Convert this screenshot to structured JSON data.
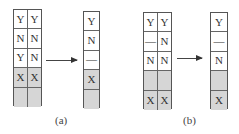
{
  "panels": [
    {
      "label": "(a)",
      "before": {
        "rows": [
          {
            "cells": [
              "Y",
              "Y"
            ],
            "shaded": false
          },
          {
            "cells": [
              "N",
              "N"
            ],
            "shaded": false
          },
          {
            "cells": [
              "Y",
              "N"
            ],
            "shaded": false
          },
          {
            "cells": [
              "X",
              "X"
            ],
            "shaded": true
          },
          {
            "cells": [
              "",
              ""
            ],
            "shaded": true
          }
        ]
      },
      "after": {
        "rows": [
          {
            "cells": [
              "Y"
            ],
            "shaded": false
          },
          {
            "cells": [
              "N"
            ],
            "shaded": false
          },
          {
            "cells": [
              "—"
            ],
            "shaded": false
          },
          {
            "cells": [
              "X"
            ],
            "shaded": true
          },
          {
            "cells": [
              ""
            ],
            "shaded": true
          }
        ]
      }
    },
    {
      "label": "(b)",
      "before": {
        "rows": [
          {
            "cells": [
              "Y",
              "Y"
            ],
            "shaded": false
          },
          {
            "cells": [
              "—",
              "N"
            ],
            "shaded": false
          },
          {
            "cells": [
              "N",
              "N"
            ],
            "shaded": false
          },
          {
            "cells": [
              "",
              ""
            ],
            "shaded": true
          },
          {
            "cells": [
              "X",
              "X"
            ],
            "shaded": true
          }
        ]
      },
      "after": {
        "rows": [
          {
            "cells": [
              "Y"
            ],
            "shaded": false
          },
          {
            "cells": [
              "—"
            ],
            "shaded": false
          },
          {
            "cells": [
              "N"
            ],
            "shaded": false
          },
          {
            "cells": [
              ""
            ],
            "shaded": true
          },
          {
            "cells": [
              "X"
            ],
            "shaded": true
          }
        ]
      }
    }
  ],
  "colors": {
    "shade": "#d6d6d6",
    "border": "#555555"
  }
}
